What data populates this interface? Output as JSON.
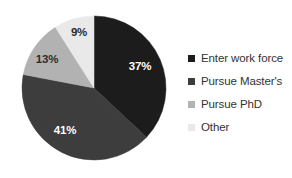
{
  "chart_data": {
    "type": "pie",
    "title": "",
    "subtitle": "",
    "xlabel": "",
    "ylabel": "",
    "grid": false,
    "legend_position": "right",
    "start_angle_deg": 0,
    "direction": "clockwise",
    "categories": [
      "Enter work force",
      "Pursue Master's",
      "Pursue PhD",
      "Other"
    ],
    "values": [
      37,
      41,
      13,
      9
    ],
    "unit": "%",
    "data_labels": [
      "37%",
      "41%",
      "13%",
      "9%"
    ],
    "colors": [
      "#1c1c1c",
      "#3d3d3d",
      "#b2b2b2",
      "#e9e9e9"
    ],
    "label_colors": [
      "#ffffff",
      "#ffffff",
      "#2b2b2b",
      "#2b2b2b"
    ],
    "slices": [
      {
        "name": "Enter work force",
        "value": 37,
        "label": "37%",
        "color": "#1c1c1c",
        "label_color": "#ffffff",
        "label_x": 140,
        "label_y": 67
      },
      {
        "name": "Pursue Master's",
        "value": 41,
        "label": "41%",
        "color": "#3d3d3d",
        "label_color": "#ffffff",
        "label_x": 65,
        "label_y": 131
      },
      {
        "name": "Pursue PhD",
        "value": 13,
        "label": "13%",
        "color": "#b2b2b2",
        "label_color": "#2b2b2b",
        "label_x": 47,
        "label_y": 60
      },
      {
        "name": "Other",
        "value": 9,
        "label": "9%",
        "color": "#e9e9e9",
        "label_color": "#2b2b2b",
        "label_x": 79,
        "label_y": 33
      }
    ],
    "geometry": {
      "center_x": 94,
      "center_y": 88,
      "radius": 72
    }
  },
  "legend": {
    "items": [
      {
        "label": "Enter work force",
        "color": "#1c1c1c"
      },
      {
        "label": "Pursue Master's",
        "color": "#3d3d3d"
      },
      {
        "label": "Pursue PhD",
        "color": "#b2b2b2"
      },
      {
        "label": "Other",
        "color": "#e9e9e9"
      }
    ]
  }
}
